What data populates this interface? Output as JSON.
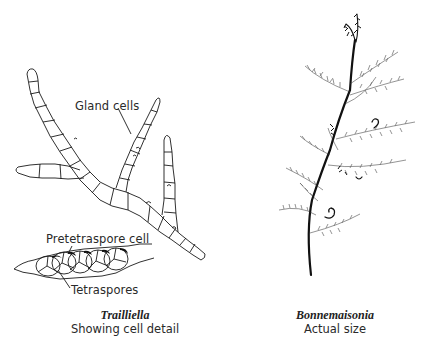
{
  "left_figure": {
    "genus": "Trailliella",
    "subtitle": "Showing cell detail",
    "labels": {
      "gland_cells": "Gland cells",
      "pretetraspore_cell": "Pretetraspore cell",
      "tetraspores": "Tetraspores"
    }
  },
  "right_figure": {
    "genus": "Bonnemaisonia",
    "subtitle": "Actual size"
  },
  "colors": {
    "line": "#1a1a1a",
    "background": "#ffffff"
  }
}
